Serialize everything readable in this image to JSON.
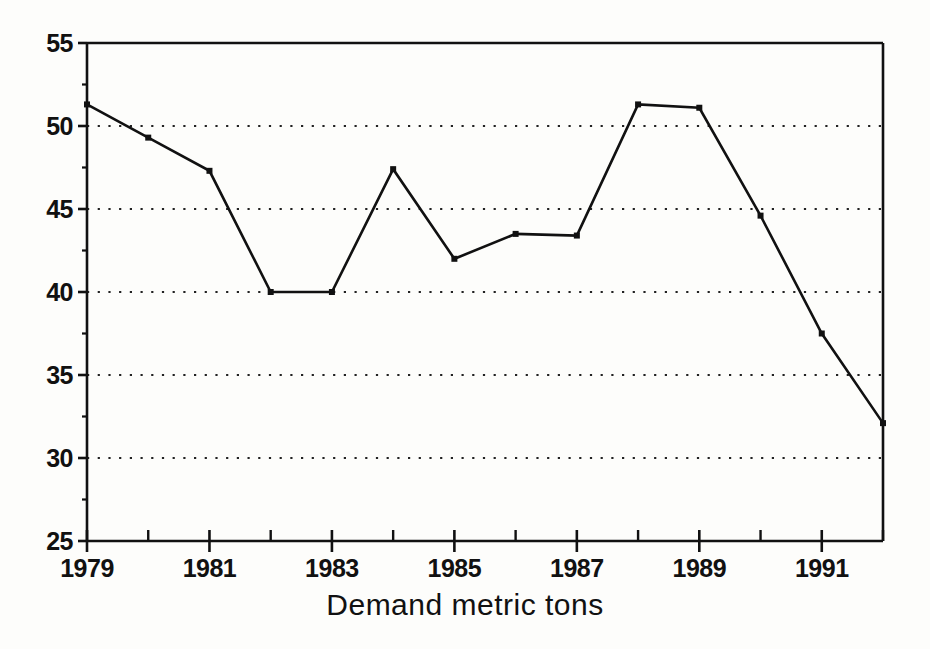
{
  "chart_data": {
    "type": "line",
    "title": "",
    "subtitle": "",
    "xlabel": "Demand metric tons",
    "ylabel": "",
    "x": [
      1979,
      1980,
      1981,
      1982,
      1983,
      1984,
      1985,
      1986,
      1987,
      1988,
      1989,
      1990,
      1991,
      1992
    ],
    "values": [
      51.3,
      49.3,
      47.3,
      40.0,
      40.0,
      47.4,
      42.0,
      43.5,
      43.4,
      51.3,
      51.1,
      44.6,
      37.5,
      32.1
    ],
    "series": [
      {
        "name": "Demand metric tons",
        "values": [
          51.3,
          49.3,
          47.3,
          40.0,
          40.0,
          47.4,
          42.0,
          43.5,
          43.4,
          51.3,
          51.1,
          44.6,
          37.5,
          32.1
        ]
      }
    ],
    "xlim": [
      1979,
      1992
    ],
    "ylim": [
      25,
      55
    ],
    "ytick_values": [
      25,
      30,
      35,
      40,
      45,
      50,
      55
    ],
    "ytick_labels": [
      "25",
      "30",
      "35",
      "40",
      "45",
      "50",
      "55"
    ],
    "xtick_values": [
      1979,
      1981,
      1983,
      1985,
      1987,
      1989,
      1991
    ],
    "xtick_labels": [
      "1979",
      "1981",
      "1983",
      "1985",
      "1987",
      "1989",
      "1991"
    ],
    "xtick_minor_values": [
      1980,
      1982,
      1984,
      1986,
      1988,
      1990,
      1992
    ],
    "grid": {
      "horizontal": true,
      "vertical": false,
      "style": "dotted",
      "levels": [
        30,
        35,
        40,
        45,
        50
      ]
    },
    "legend": {
      "visible": false,
      "position": "none",
      "entries": []
    },
    "marker": "square",
    "line_color": "#111111",
    "grid_color": "#222222",
    "axis_color": "#111111",
    "background_color": "#fdfdfb"
  }
}
